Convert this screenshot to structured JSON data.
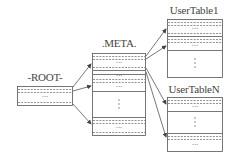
{
  "diagram": {
    "type": "hierarchical-table-lookup",
    "nodes": [
      {
        "id": "root",
        "label": "-ROOT-"
      },
      {
        "id": "meta",
        "label": ".META."
      },
      {
        "id": "usertable1",
        "label": "UserTable1"
      },
      {
        "id": "usertableN",
        "label": "UserTableN"
      }
    ],
    "ellipsis_h": "...",
    "ellipsis_v": "⋮",
    "edges": [
      {
        "from": "root",
        "to": "meta",
        "count": 3
      },
      {
        "from": "meta",
        "to": "usertable1",
        "count": 2
      },
      {
        "from": "meta",
        "to": "usertableN",
        "count": 2
      }
    ],
    "colors": {
      "line": "#555555",
      "dash": "#777777",
      "background": "#ffffff"
    }
  }
}
